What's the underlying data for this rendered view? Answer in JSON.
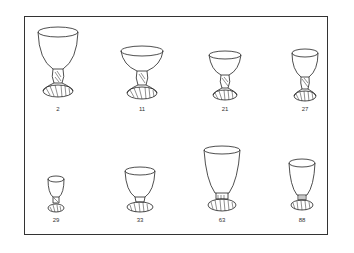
{
  "plate": {
    "border_color": "#333333",
    "background": "#ffffff"
  },
  "glasses": [
    {
      "label": "2",
      "row": 1,
      "shape": "tall-bell-goblet"
    },
    {
      "label": "11",
      "row": 1,
      "shape": "wide-champagne-coupe"
    },
    {
      "label": "21",
      "row": 1,
      "shape": "cocktail-cup"
    },
    {
      "label": "27",
      "row": 1,
      "shape": "tall-wine"
    },
    {
      "label": "29",
      "row": 2,
      "shape": "small-cordial"
    },
    {
      "label": "33",
      "row": 2,
      "shape": "footed-tumbler"
    },
    {
      "label": "63",
      "row": 2,
      "shape": "tall-footed-iced-tea"
    },
    {
      "label": "88",
      "row": 2,
      "shape": "footed-juice"
    }
  ]
}
